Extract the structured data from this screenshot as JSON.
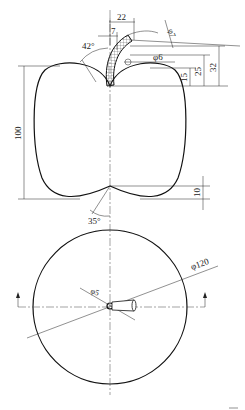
{
  "drawing": {
    "subject": "apple",
    "front_view": {
      "section": "hatched cross-section",
      "dimensions": {
        "stem_width_top": "22",
        "stem_offset": "7",
        "stem_angle": "42°",
        "stem_tip_diameter": "φ7",
        "stem_base_diameter": "φ6",
        "height_total": "100",
        "dim_15": "15",
        "dim_25": "25",
        "dim_32": "32",
        "bottom_offset": "10",
        "bottom_angle": "35°"
      }
    },
    "top_view": {
      "outer_diameter": "φ120",
      "stem_diameter": "φ5"
    },
    "colors": {
      "line": "#111111",
      "background": "#ffffff"
    }
  }
}
